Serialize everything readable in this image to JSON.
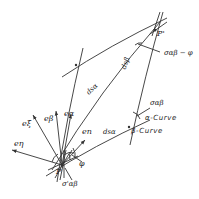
{
  "diagram": {
    "title": "",
    "points": {
      "P": "P",
      "P_prime": "P'"
    },
    "vectors": {
      "e_eta": "eη",
      "e_xi": "eξ",
      "e_beta": "eβ",
      "e_alpha": "eα",
      "e_n": "en"
    },
    "elements": {
      "ds_alpha_top": "dsα",
      "ds_alpha_bottom": "dsα",
      "ds_beta": "dsβ"
    },
    "angles": {
      "sigma_ab_minus_phi": "σαβ − φ",
      "sigma_ab": "σαβ",
      "phi": "φ",
      "sigma_ab_prime": "σ'αβ"
    },
    "curves": {
      "alpha": "α-Curve",
      "beta": "β-Curve"
    },
    "colors": {
      "line": "#333333",
      "background": "#ffffff"
    }
  }
}
